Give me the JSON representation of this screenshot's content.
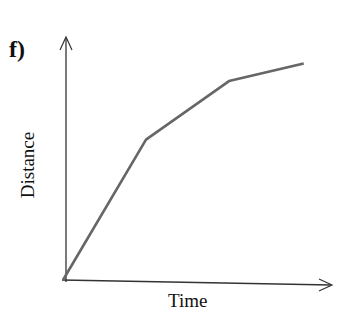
{
  "figure": {
    "label": "f)"
  },
  "chart_data": {
    "type": "line",
    "title": "",
    "xlabel": "Time",
    "ylabel": "Distance",
    "x": [
      0,
      1.0,
      2.0,
      2.9
    ],
    "series": [
      {
        "name": "distance-time",
        "values": [
          0,
          2.4,
          3.4,
          3.7
        ]
      }
    ],
    "ticks": "none",
    "grid": false,
    "legend": "none",
    "line_color": "#666666",
    "axis_color": "#333333"
  }
}
